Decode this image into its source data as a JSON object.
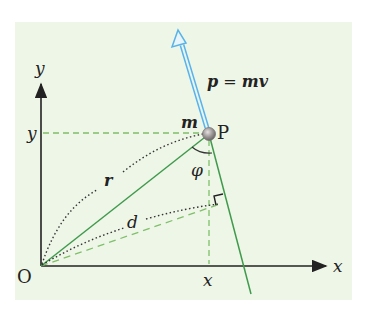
{
  "figure": {
    "labels": {
      "y_axis": "y",
      "x_axis": "x",
      "origin": "O",
      "point": "P",
      "mass": "m",
      "y_coord": "y",
      "x_coord": "x",
      "r": "r",
      "d": "d",
      "phi": "φ",
      "momentum_p": "p",
      "momentum_eq": " = ",
      "momentum_mv": "mv"
    },
    "colors": {
      "background": "#eef6e7",
      "axis": "#222222",
      "green_line": "#3f9a4c",
      "dashed": "#7fbf6a",
      "momentum_arrow": "#5ab3e6",
      "ball": "#9a9394"
    }
  }
}
